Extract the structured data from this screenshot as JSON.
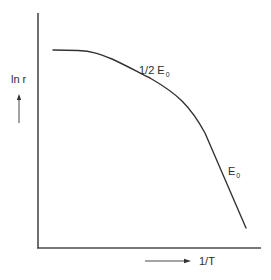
{
  "diagram": {
    "type": "arrhenius-plot",
    "y_axis": {
      "label": "ln r",
      "arrow_direction": "up"
    },
    "x_axis": {
      "label": "1/T",
      "arrow_direction": "right"
    },
    "curve": {
      "description": "Curve flat at low 1/T region, then bending down to a steep straight-line region",
      "color": "#333333"
    },
    "annotations": [
      {
        "id": "half",
        "text": "1/2 E",
        "subscript": "0",
        "region": "intermediate slope"
      },
      {
        "id": "full",
        "text": "E",
        "subscript": "0",
        "region": "steep slope"
      }
    ],
    "colors": {
      "axes": "#4a4a4a",
      "text": "#2b2b2b",
      "background": "#ffffff"
    }
  }
}
